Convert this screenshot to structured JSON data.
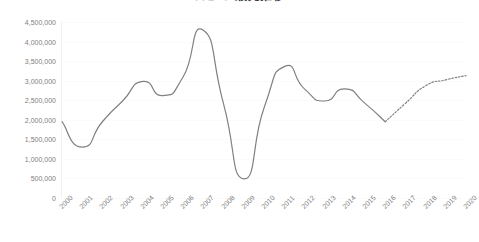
{
  "chart_data": {
    "type": "line",
    "title": "ＡＢＣ 販売推移",
    "subtitle": "",
    "xlabel": "",
    "ylabel": "",
    "categories": [
      "2000",
      "2001",
      "2002",
      "2003",
      "2004",
      "2005",
      "2006",
      "2007",
      "2008",
      "2009",
      "2010",
      "2011",
      "2012",
      "2013",
      "2014",
      "2015",
      "2016",
      "2017",
      "2018",
      "2019",
      "2020"
    ],
    "series": [
      {
        "name": "actual",
        "style": "solid",
        "color": "#808080",
        "values": [
          1950000,
          1300000,
          1950000,
          2480000,
          2980000,
          2620000,
          3100000,
          4290000,
          2400000,
          490000,
          2300000,
          3360000,
          2790000,
          2480000,
          2790000,
          2420000,
          1950000,
          null,
          null,
          null,
          null
        ]
      },
      {
        "name": "forecast",
        "style": "dotted",
        "color": "#808080",
        "values": [
          null,
          null,
          null,
          null,
          null,
          null,
          null,
          null,
          null,
          null,
          null,
          null,
          null,
          null,
          null,
          null,
          1950000,
          2420000,
          2870000,
          3020000,
          3130000
        ]
      }
    ],
    "ytick_labels": [
      "0",
      "500,000",
      "1,000,000",
      "1,500,000",
      "2,000,000",
      "2,500,000",
      "3,000,000",
      "3,500,000",
      "4,000,000",
      "4,500,000"
    ],
    "ytick_values": [
      0,
      500000,
      1000000,
      1500000,
      2000000,
      2500000,
      3000000,
      3500000,
      4000000,
      4500000
    ],
    "ylim": [
      0,
      4500000
    ],
    "xlim": [
      "2000",
      "2020"
    ],
    "grid": "horizontal-faint",
    "legend": "none",
    "line_color": "#808080",
    "grid_color": "#f2f2f2",
    "text_color": "#808080",
    "annotations": []
  }
}
